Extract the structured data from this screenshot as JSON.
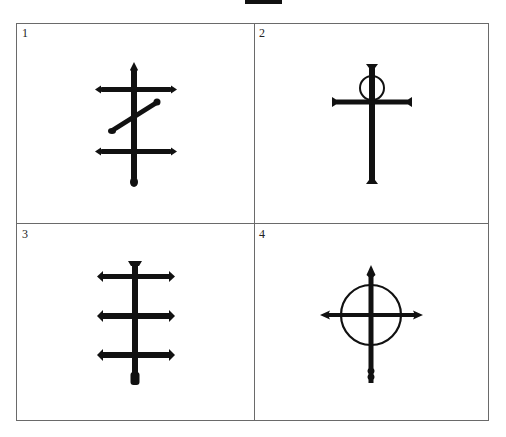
{
  "figure": {
    "panels": [
      {
        "label": "1",
        "symbol": "cross-with-two-bars-and-diagonal"
      },
      {
        "label": "2",
        "symbol": "cross-with-circle-at-top"
      },
      {
        "label": "3",
        "symbol": "triple-barred-cross"
      },
      {
        "label": "4",
        "symbol": "circled-cross-with-arrow-tips"
      }
    ]
  },
  "colors": {
    "ink": "#111111",
    "border": "#6a6a6a",
    "background": "#ffffff"
  }
}
